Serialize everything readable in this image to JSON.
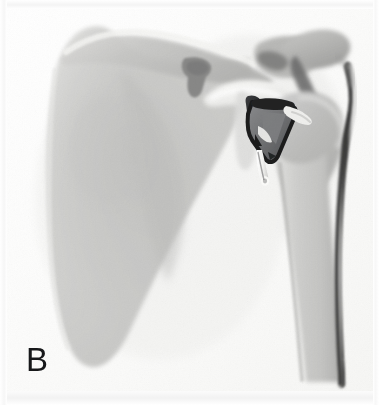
{
  "figure": {
    "panel_label": "B",
    "modality": "radiograph",
    "view": "anteroposterior-shoulder",
    "width": 379,
    "height": 405,
    "background_color": "#fdfdfd",
    "film_tone_light": "#f1f1f0",
    "film_tone_mid": "#c9c9c7",
    "film_tone_dark": "#8d8d8c"
  },
  "anatomy": {
    "structures": [
      {
        "name": "scapula-body",
        "label": "Scapula body",
        "fill": "#cfcfcd",
        "edge": "#bcbcba"
      },
      {
        "name": "scapular-spine",
        "label": "Scapular spine",
        "fill": "#c2c2c0",
        "edge": "#a9a9a7"
      },
      {
        "name": "suprascapular-notch",
        "label": "Suprascapular notch",
        "fill": "#8f8f8e",
        "edge": "#7c7c7b"
      },
      {
        "name": "coracoid-process",
        "label": "Coracoid process",
        "fill": "#eeeeec",
        "edge": "#d6d6d4"
      },
      {
        "name": "acromion",
        "label": "Acromion",
        "fill": "#b6b6b4",
        "edge": "#9e9e9c"
      },
      {
        "name": "clavicle",
        "label": "Distal clavicle",
        "fill": "#b9b9b7",
        "edge": "#a0a09e"
      },
      {
        "name": "acromioclavicular-shadow",
        "label": "Acromioclavicular shadow",
        "fill": "#6f6f6e",
        "edge": "#5d5d5c"
      },
      {
        "name": "humeral-head",
        "label": "Humeral head",
        "fill": "#bdbdbb",
        "edge": "#a6a6a4"
      },
      {
        "name": "humeral-shaft",
        "label": "Humeral shaft",
        "fill": "#cbcbc9",
        "edge": "#b4b4b2"
      },
      {
        "name": "lateral-cortex-line",
        "label": "Lateral humeral cortex",
        "fill": "#4a4a49",
        "edge": "#3a3a39"
      },
      {
        "name": "glenoid-rim",
        "label": "Glenoid rim",
        "fill": "#d9d9d7",
        "edge": "#c0c0be"
      },
      {
        "name": "soft-tissue-shadow",
        "label": "Soft tissue shadow",
        "fill": "#e7e7e5",
        "edge": "#dcdcda"
      }
    ]
  },
  "implant": {
    "name": "glenoid-implant",
    "label": "Metallic glenoid implant",
    "description": "Radiopaque wedge-shaped metallic component seated at the glenoid with an inferior peg",
    "body_color": "#2d2e30",
    "body_color_light": "#6a6b6d",
    "highlight_color": "#f4f4f2",
    "peg_color": "#f7f7f5",
    "peg_shadow": "#55565a",
    "components": [
      {
        "name": "implant-superior-strut",
        "label": "Superior strut"
      },
      {
        "name": "implant-wedge-body",
        "label": "Wedge body"
      },
      {
        "name": "implant-lateral-flange",
        "label": "Lateral flange"
      },
      {
        "name": "implant-inferior-peg",
        "label": "Inferior peg"
      }
    ]
  }
}
